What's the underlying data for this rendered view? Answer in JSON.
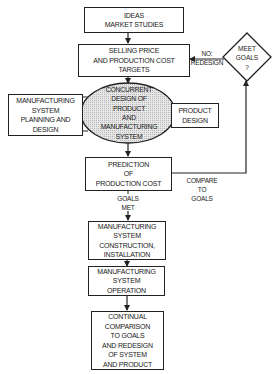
{
  "diagram": {
    "type": "flowchart",
    "nodes": {
      "ideas": {
        "lines": [
          "IDEAS",
          "MARKET STUDIES"
        ]
      },
      "targets": {
        "lines": [
          "SELLING PRICE",
          "AND PRODUCTION COST",
          "TARGETS"
        ]
      },
      "concurrent": {
        "shape": "ellipse",
        "lines": [
          "CONCURRENT",
          "DESIGN OF",
          "PRODUCT",
          "AND",
          "MANUFACTURING",
          "SYSTEM"
        ]
      },
      "mfg_planning": {
        "lines": [
          "MANUFACTURING",
          "SYSTEM",
          "PLANNING AND",
          "DESIGN"
        ]
      },
      "product_design": {
        "lines": [
          "PRODUCT",
          "DESIGN"
        ]
      },
      "prediction": {
        "lines": [
          "PREDICTION",
          "OF",
          "PRODUCTION COST"
        ]
      },
      "meet_goals": {
        "shape": "diamond",
        "lines": [
          "MEET",
          "GOALS",
          "?"
        ]
      },
      "construction": {
        "lines": [
          "MANUFACTURING",
          "SYSTEM",
          "CONSTRUCTION,",
          "INSTALLATION"
        ]
      },
      "operation": {
        "lines": [
          "MANUFACTURING",
          "SYSTEM",
          "OPERATION"
        ]
      },
      "continual": {
        "lines": [
          "CONTINUAL",
          "COMPARISON",
          "TO GOALS",
          "AND REDESIGN",
          "OF SYSTEM",
          "AND PRODUCT"
        ]
      }
    },
    "edge_labels": {
      "no_redesign": [
        "NO:",
        "REDESIGN"
      ],
      "compare_to_goals": [
        "COMPARE",
        "TO",
        "GOALS"
      ],
      "goals_met": [
        "GOALS",
        "MET"
      ]
    },
    "colors": {
      "stroke": "#222222",
      "ellipse_fill": "#d9d9d9",
      "background": "#ffffff"
    }
  }
}
